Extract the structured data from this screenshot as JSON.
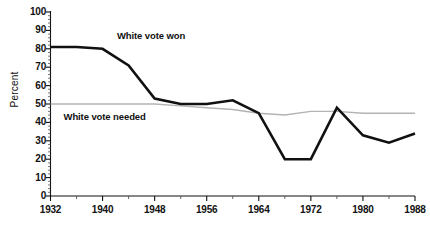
{
  "chart_data": {
    "type": "line",
    "title": "",
    "xlabel": "",
    "ylabel": "Percent",
    "xlim": [
      1932,
      1988
    ],
    "ylim": [
      0,
      100
    ],
    "grid": false,
    "legend_position": "inline-annotation",
    "y_ticks": [
      0,
      10,
      20,
      30,
      40,
      50,
      60,
      70,
      80,
      90,
      100
    ],
    "y_tick_labels": [
      "0",
      "10",
      "20",
      "30",
      "40",
      "50",
      "60",
      "70",
      "80",
      "90",
      "100"
    ],
    "x_ticks": [
      1932,
      1940,
      1948,
      1956,
      1964,
      1972,
      1980,
      1988
    ],
    "x_tick_labels": [
      "1932",
      "1940",
      "1948",
      "1956",
      "1964",
      "1972",
      "1980",
      "1988"
    ],
    "x_minor_ticks": [
      1936,
      1944,
      1952,
      1960,
      1968,
      1976,
      1984
    ],
    "x": [
      1932,
      1936,
      1940,
      1944,
      1948,
      1952,
      1956,
      1960,
      1964,
      1968,
      1972,
      1976,
      1980,
      1984,
      1988
    ],
    "series": [
      {
        "name": "White vote won",
        "color": "#111111",
        "width": 2.6,
        "values": [
          81,
          81,
          80,
          71,
          53,
          50,
          50,
          52,
          45,
          20,
          20,
          48,
          33,
          29,
          34
        ]
      },
      {
        "name": "White vote needed",
        "color": "#b3b3b3",
        "width": 1.4,
        "values": [
          50,
          50,
          50,
          50,
          50,
          49,
          48,
          47,
          45,
          44,
          46,
          46,
          45,
          45,
          45
        ]
      }
    ],
    "annotations": [
      {
        "text": "White vote won",
        "x": 1942.2,
        "y": 87
      },
      {
        "text": "White vote needed",
        "x": 1934.0,
        "y": 43
      }
    ]
  }
}
